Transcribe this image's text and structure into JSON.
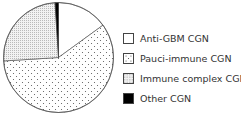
{
  "chart_data": {
    "type": "pie",
    "title": "",
    "start_angle_deg": 0,
    "direction": "clockwise",
    "categories": [
      "Anti-GBM CGN",
      "Pauci-immune CGN",
      "Immune complex CGN",
      "Other CGN"
    ],
    "values": [
      15,
      59,
      25,
      1
    ],
    "unit": "%",
    "fills": [
      "white",
      "sparse-dots",
      "dense-dots",
      "black"
    ],
    "legend_position": "right"
  },
  "legend": {
    "items": [
      {
        "label": "Anti-GBM CGN",
        "fill": "white"
      },
      {
        "label": "Pauci-immune CGN",
        "fill": "sparse-dots"
      },
      {
        "label": "Immune complex CGN",
        "fill": "dense-dots"
      },
      {
        "label": "Other CGN",
        "fill": "black"
      }
    ]
  }
}
